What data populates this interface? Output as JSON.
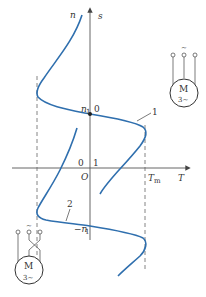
{
  "diagram": {
    "type": "induction-motor-mechanical-characteristic",
    "axes": {
      "vertical_label_left": "n",
      "vertical_label_right": "s",
      "horizontal_label": "T",
      "origin_label": "O",
      "tm_label": "T",
      "tm_sub": "m"
    },
    "markers": {
      "n1_label": "n",
      "n1_sub": "1",
      "s0_label": "0",
      "neg_n1_label": "−n",
      "neg_n1_sub": "1",
      "s0_lower_label": "0",
      "s1_label": "1"
    },
    "curves": [
      {
        "id": "1",
        "label": "1",
        "description": "forward phase sequence characteristic"
      },
      {
        "id": "2",
        "label": "2",
        "description": "reverse phase sequence characteristic"
      }
    ],
    "motors": [
      {
        "position": "top-right",
        "label": "M",
        "sub_label": "3~",
        "supply_symbol": "~",
        "wiring": "direct"
      },
      {
        "position": "bottom-left",
        "label": "M",
        "sub_label": "3~",
        "supply_symbol": "~",
        "wiring": "two-phases-swapped"
      }
    ],
    "colors": {
      "curve": "#2f6fae",
      "axis": "#555555",
      "dashed": "#666666",
      "text": "#333333"
    }
  }
}
